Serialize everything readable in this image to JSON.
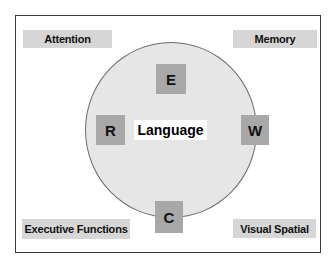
{
  "diagram": {
    "center": {
      "label": "Language",
      "components": [
        {
          "id": "E",
          "label": "E",
          "position": "top"
        },
        {
          "id": "R",
          "label": "R",
          "position": "left"
        },
        {
          "id": "W",
          "label": "W",
          "position": "right"
        },
        {
          "id": "C",
          "label": "C",
          "position": "bottom"
        }
      ]
    },
    "corners": {
      "top_left": "Attention",
      "top_right": "Memory",
      "bottom_left": "Executive Functions",
      "bottom_right": "Visual Spatial"
    },
    "colors": {
      "circle_fill": "#e6e6e6",
      "circle_stroke": "#6e6e6e",
      "letter_box": "#a8a8a8",
      "domain_box": "#d6d6d6",
      "frame": "#3a3a3a"
    }
  }
}
